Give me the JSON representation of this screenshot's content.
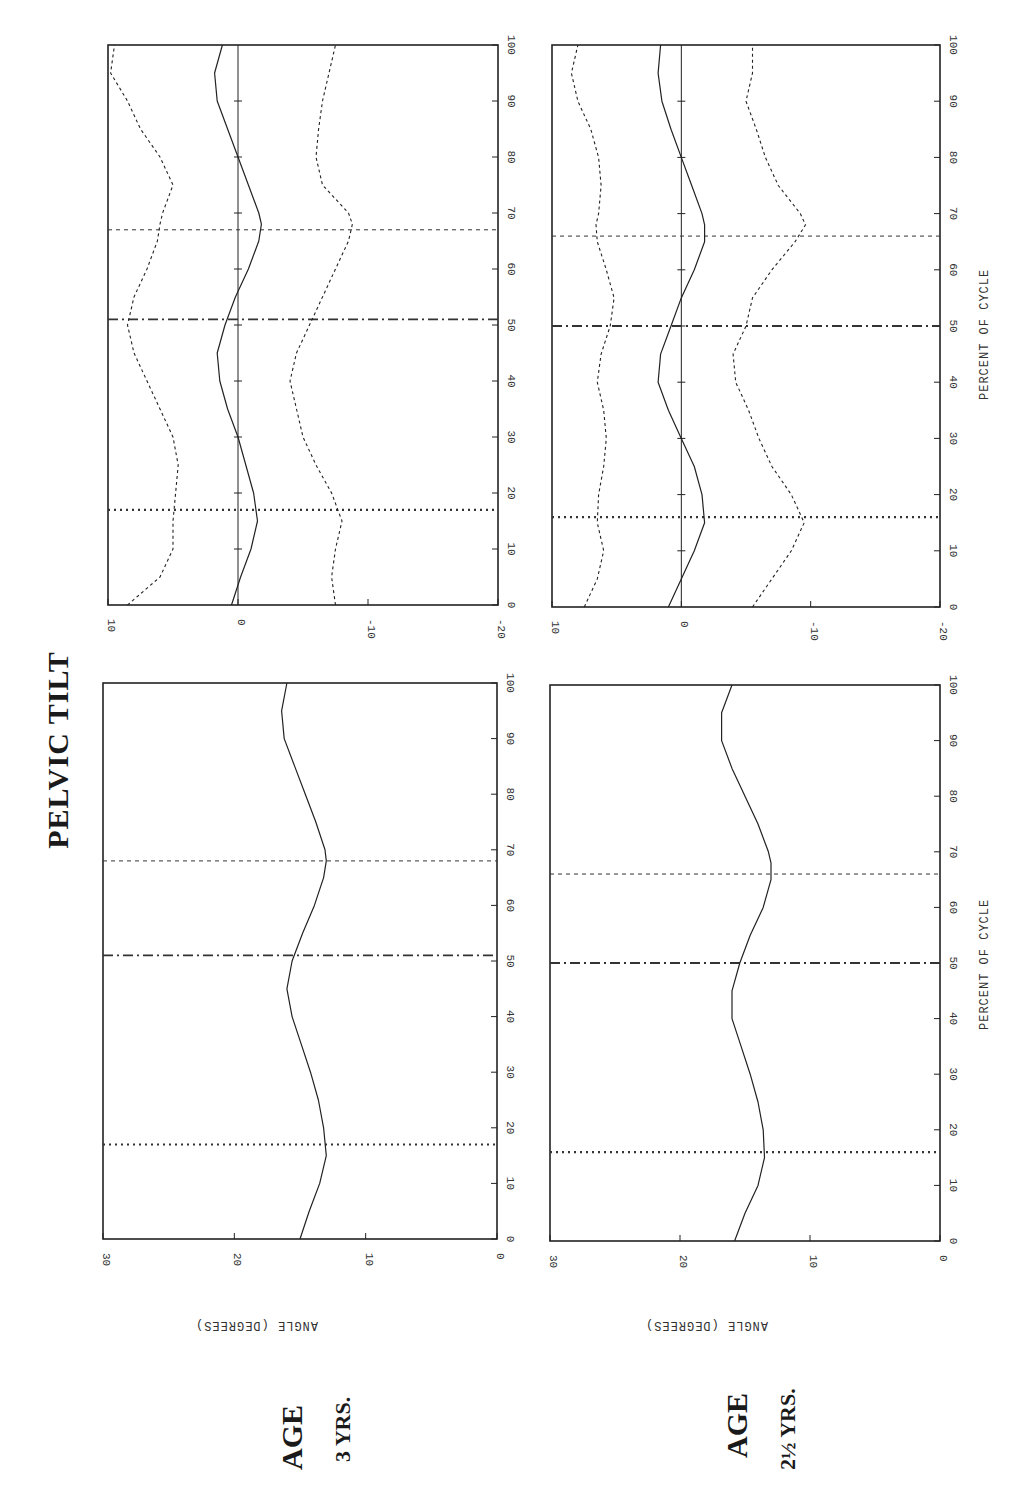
{
  "title": "PELVIC TILT",
  "x_axis_label": "PERCENT OF CYCLE",
  "y_axis_label": "ANGLE (DEGREES)",
  "rows": [
    {
      "age_word": "AGE",
      "age_value": "3 YRS."
    },
    {
      "age_word": "AGE",
      "age_value": "2½ YRS."
    }
  ],
  "x_ticks": [
    "0",
    "10",
    "20",
    "30",
    "40",
    "50",
    "60",
    "70",
    "80",
    "90",
    "100"
  ],
  "abs_y_ticks": [
    "0",
    "10",
    "20",
    "30"
  ],
  "dev_y_ticks": [
    "-20",
    "-10",
    "0",
    "10"
  ],
  "chart_data": [
    {
      "type": "line",
      "panel": "age-3-absolute",
      "title": "PELVIC TILT — Age 3 yrs",
      "xlabel": "PERCENT OF CYCLE",
      "ylabel": "ANGLE (DEGREES)",
      "xlim": [
        0,
        100
      ],
      "ylim": [
        0,
        30
      ],
      "x": [
        0,
        5,
        10,
        15,
        20,
        25,
        30,
        35,
        40,
        45,
        50,
        55,
        60,
        65,
        68,
        70,
        75,
        80,
        85,
        90,
        95,
        100
      ],
      "series": [
        {
          "name": "mean",
          "values": [
            15,
            14.3,
            13.5,
            13,
            13.2,
            13.6,
            14.2,
            14.9,
            15.6,
            16,
            15.6,
            14.8,
            13.9,
            13.2,
            13,
            13.1,
            13.8,
            14.6,
            15.4,
            16.2,
            16.4,
            16
          ]
        }
      ],
      "event_lines": [
        {
          "x": 17,
          "style": "dotted"
        },
        {
          "x": 51,
          "style": "dash-dot"
        },
        {
          "x": 68,
          "style": "dashed"
        }
      ]
    },
    {
      "type": "line",
      "panel": "age-3-deviation",
      "xlabel": "PERCENT OF CYCLE",
      "ylabel": "ANGLE (DEGREES)",
      "xlim": [
        0,
        100
      ],
      "ylim": [
        -20,
        10
      ],
      "x": [
        0,
        5,
        10,
        15,
        20,
        25,
        30,
        35,
        40,
        45,
        50,
        55,
        60,
        65,
        68,
        70,
        75,
        80,
        85,
        90,
        95,
        100
      ],
      "series": [
        {
          "name": "mean",
          "values": [
            0.5,
            -0.2,
            -1,
            -1.5,
            -1.2,
            -0.6,
            0,
            0.8,
            1.4,
            1.6,
            1,
            0.2,
            -0.8,
            -1.6,
            -1.8,
            -1.6,
            -0.8,
            0,
            0.8,
            1.6,
            1.8,
            1.2
          ]
        },
        {
          "name": "upper",
          "values": [
            8.5,
            6,
            5,
            5,
            4.8,
            4.6,
            5,
            6,
            7,
            8,
            8.5,
            8,
            7,
            6.2,
            6,
            5.8,
            5,
            6,
            7.5,
            8.5,
            9.8,
            9.5
          ]
        },
        {
          "name": "lower",
          "values": [
            -7.5,
            -7.2,
            -7.5,
            -8,
            -7.2,
            -6,
            -5,
            -4.5,
            -4,
            -4.5,
            -5.5,
            -6.5,
            -7.5,
            -8.5,
            -8.8,
            -8.5,
            -6.5,
            -6,
            -6.2,
            -6.5,
            -7,
            -7.5
          ]
        }
      ],
      "event_lines": [
        {
          "x": 17,
          "style": "dotted"
        },
        {
          "x": 51,
          "style": "dash-dot"
        },
        {
          "x": 67,
          "style": "dashed"
        }
      ]
    },
    {
      "type": "line",
      "panel": "age-2.5-absolute",
      "title": "PELVIC TILT — Age 2 1/2 yrs",
      "xlabel": "PERCENT OF CYCLE",
      "ylabel": "ANGLE (DEGREES)",
      "xlim": [
        0,
        100
      ],
      "ylim": [
        0,
        30
      ],
      "x": [
        0,
        5,
        10,
        15,
        20,
        25,
        30,
        35,
        40,
        45,
        50,
        55,
        60,
        65,
        68,
        70,
        75,
        80,
        85,
        90,
        95,
        100
      ],
      "series": [
        {
          "name": "mean",
          "values": [
            15.8,
            15,
            14,
            13.5,
            13.6,
            14,
            14.6,
            15.3,
            16,
            16,
            15.4,
            14.6,
            13.6,
            13,
            13,
            13.2,
            14,
            15,
            16,
            16.8,
            16.8,
            16
          ]
        }
      ],
      "event_lines": [
        {
          "x": 16,
          "style": "dotted"
        },
        {
          "x": 50,
          "style": "dash-dot"
        },
        {
          "x": 66,
          "style": "dashed"
        }
      ]
    },
    {
      "type": "line",
      "panel": "age-2.5-deviation",
      "xlabel": "PERCENT OF CYCLE",
      "ylabel": "ANGLE (DEGREES)",
      "xlim": [
        0,
        100
      ],
      "ylim": [
        -20,
        10
      ],
      "x": [
        0,
        5,
        10,
        15,
        20,
        25,
        30,
        35,
        40,
        45,
        50,
        55,
        60,
        65,
        68,
        70,
        75,
        80,
        85,
        90,
        95,
        100
      ],
      "series": [
        {
          "name": "mean",
          "values": [
            1,
            0,
            -1,
            -1.8,
            -1.6,
            -1,
            0,
            1,
            1.8,
            1.6,
            0.8,
            0,
            -1,
            -1.8,
            -1.8,
            -1.6,
            -0.8,
            0,
            0.8,
            1.5,
            1.8,
            1.6
          ]
        },
        {
          "name": "upper",
          "values": [
            7.5,
            6.5,
            6,
            6.5,
            6.4,
            6,
            5.8,
            6,
            6.5,
            6.2,
            5.5,
            5.2,
            5.8,
            6.5,
            6.6,
            6.4,
            6.2,
            6.4,
            7,
            8,
            8.5,
            8
          ]
        },
        {
          "name": "lower",
          "values": [
            -5.5,
            -7,
            -8.5,
            -9.5,
            -8.5,
            -7,
            -6,
            -5.2,
            -4.2,
            -4,
            -5,
            -5.5,
            -7,
            -8.8,
            -9.6,
            -9.2,
            -7.5,
            -6.5,
            -5.8,
            -5,
            -5.5,
            -5.5
          ]
        }
      ],
      "event_lines": [
        {
          "x": 16,
          "style": "dotted"
        },
        {
          "x": 50,
          "style": "dash-dot"
        },
        {
          "x": 66,
          "style": "dashed"
        }
      ]
    }
  ]
}
